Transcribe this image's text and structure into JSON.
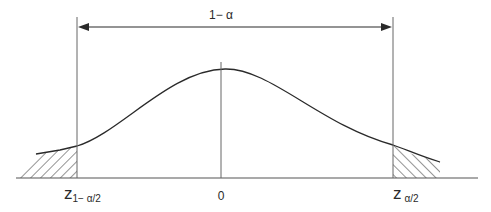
{
  "diagram": {
    "type": "normal-distribution-confidence-interval",
    "interval_label": "1− α",
    "center_label": "0",
    "left_critical": {
      "symbol": "z",
      "subscript": "1− α/2"
    },
    "right_critical": {
      "symbol": "z",
      "subscript": "α/2"
    },
    "shaded_regions": [
      "left-tail",
      "right-tail"
    ],
    "colors": {
      "stroke": "#2a2a2a",
      "background": "#ffffff"
    }
  }
}
